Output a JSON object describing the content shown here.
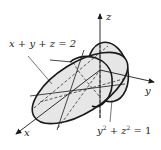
{
  "diagram": {
    "type": "3d-surface-intersection",
    "axes": {
      "x": "x",
      "y": "y",
      "z": "z"
    },
    "plane_label": {
      "text": "x + y + z = 2"
    },
    "cylinder_label": {
      "lhs_y": "y",
      "exp": "2",
      "plus": "+",
      "lhs_z": "z",
      "exp2": "2",
      "eq": "= 1"
    },
    "colors": {
      "fill": "#e6e6e6",
      "stroke": "#1a1a1a"
    }
  }
}
